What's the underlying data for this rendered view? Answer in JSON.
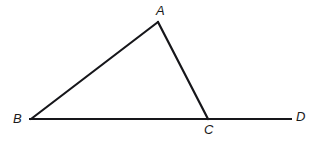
{
  "figure": {
    "name": "triangle-abc-extended-base",
    "width": 321,
    "height": 143,
    "background_color": "#ffffff",
    "stroke_color": "#16161a",
    "stroke_width": 2.2,
    "label_color": "#1a1a1a"
  },
  "points": {
    "A": {
      "label": "A",
      "x": 158,
      "y": 22,
      "label_x": 156,
      "label_y": 4
    },
    "B": {
      "label": "B",
      "x": 31,
      "y": 119,
      "label_x": 13,
      "label_y": 112
    },
    "C": {
      "label": "C",
      "x": 208,
      "y": 119,
      "label_x": 204,
      "label_y": 123
    },
    "D": {
      "label": "D",
      "x": 292,
      "y": 119,
      "label_x": 296,
      "label_y": 110
    }
  },
  "segments": [
    {
      "name": "segment-ab",
      "from": "B",
      "to": "A",
      "x1": 31,
      "y1": 119,
      "x2": 158,
      "y2": 22
    },
    {
      "name": "segment-ac",
      "from": "A",
      "to": "C",
      "x1": 158,
      "y1": 22,
      "x2": 208,
      "y2": 119
    },
    {
      "name": "segment-bd",
      "from": "B",
      "to": "D",
      "x1": 29,
      "y1": 119,
      "x2": 292,
      "y2": 119
    }
  ]
}
